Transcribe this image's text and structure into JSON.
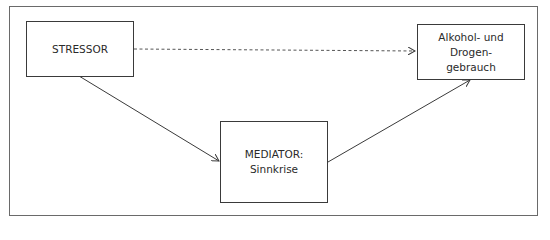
{
  "diagram": {
    "type": "mediation-model",
    "nodes": {
      "stressor": {
        "label": "STRESSOR"
      },
      "outcome": {
        "lines": [
          "Alkohol- und",
          "Drogen-",
          "gebrauch"
        ]
      },
      "mediator": {
        "lines": [
          "MEDIATOR:",
          "Sinnkrise"
        ]
      }
    },
    "edges": [
      {
        "from": "stressor",
        "to": "outcome",
        "style": "dashed"
      },
      {
        "from": "stressor",
        "to": "mediator",
        "style": "solid"
      },
      {
        "from": "mediator",
        "to": "outcome",
        "style": "solid"
      }
    ],
    "colors": {
      "line": "#3a3a3a",
      "frame": "#6a6a6a",
      "background": "#ffffff"
    }
  }
}
